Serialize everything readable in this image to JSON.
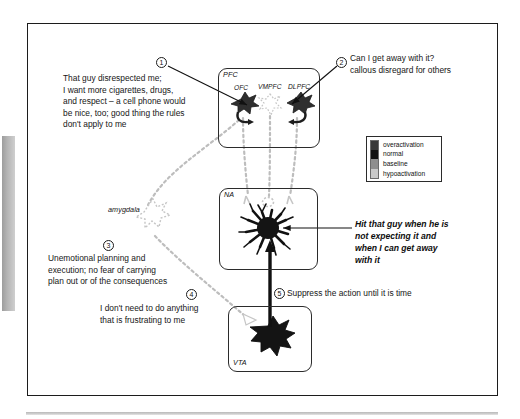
{
  "figure": {
    "type": "neurocircuitry-diagram",
    "title_text": "",
    "regions": [
      {
        "id": "pfc",
        "label": "PFC"
      },
      {
        "id": "na",
        "label": "NA"
      },
      {
        "id": "vta",
        "label": "VTA"
      },
      {
        "id": "amygdala",
        "label": "amygdala"
      }
    ],
    "subregions": [
      {
        "id": "ofc",
        "label": "OFC",
        "state": "overactivation"
      },
      {
        "id": "vmpfc",
        "label": "VMPFC",
        "state": "hypoactivation"
      },
      {
        "id": "dlpfc",
        "label": "DLPFC",
        "state": "overactivation"
      }
    ],
    "neuron_states": {
      "na_neuron": "overactivation",
      "vta_neuron": "overactivation",
      "amygdala_neuron": "hypoactivation",
      "na_terminals": "hypoactivation"
    }
  },
  "markers": {
    "m1": "1",
    "m2": "2",
    "m3": "3",
    "m4": "4",
    "m5": "5"
  },
  "callouts": {
    "c1": "That guy disrespected me;\nI want more cigarettes, drugs,\nand respect – a cell phone would\nbe nice, too; good thing the rules\ndon't apply to me",
    "c2": "Can I get away with it?\ncallous disregard for others",
    "c3": "Unemotional planning and\nexecution; no fear of carrying\nplan out or of the consequences",
    "c4": "I don't need to do anything\nthat is frustrating to me",
    "c5": "Suppress the action until it is time",
    "action": "Hit that guy when he is\nnot expecting it and\nwhen I can get away\nwith it"
  },
  "legend": {
    "items": [
      {
        "label": "overactivation",
        "color": "#3a3a3a"
      },
      {
        "label": "normal",
        "color": "#111111"
      },
      {
        "label": "baseline",
        "color": "#8e8e8e"
      },
      {
        "label": "hypoactivation",
        "color": "#c9c9c9"
      }
    ]
  },
  "colors": {
    "frame": "#1c1c1c",
    "box_border": "#2b2b2b",
    "dashed_path": "#b9b9b9",
    "solid_arrow": "#111111",
    "text": "#161616",
    "page_rule": "#c2c2c2"
  }
}
